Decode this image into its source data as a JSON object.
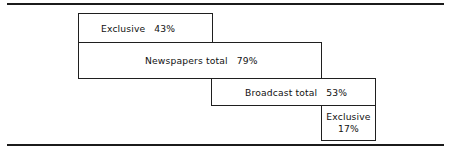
{
  "chart_data": {
    "type": "bar",
    "title": "",
    "subtitle": "",
    "xlabel": "",
    "ylabel": "",
    "orientation": "horizontal",
    "style": "nested staircase / cascading outline bars",
    "grid": false,
    "legend": false,
    "units": "percent",
    "categories": [
      "Exclusive",
      "Newspapers total",
      "Broadcast total",
      "Exclusive"
    ],
    "values": [
      43,
      79,
      53,
      17
    ],
    "value_labels": [
      "43%",
      "79%",
      "53%",
      "17%"
    ],
    "xlim": [
      0,
      100
    ],
    "bars": [
      {
        "label": "Exclusive",
        "value": 43,
        "value_label": "43%",
        "group": "Newspapers",
        "row": 1
      },
      {
        "label": "Newspapers total",
        "value": 79,
        "value_label": "79%",
        "group": "Newspapers",
        "row": 2
      },
      {
        "label": "Broadcast total",
        "value": 53,
        "value_label": "53%",
        "group": "Broadcast",
        "row": 3
      },
      {
        "label": "Exclusive",
        "value": 17,
        "value_label": "17%",
        "group": "Broadcast",
        "row": 4
      }
    ],
    "colors": {
      "background": "#ffffff",
      "bar_fill": "#ffffff",
      "bar_outline": "#1f1f1f",
      "rule": "#1b1b1b",
      "text": "#111111"
    }
  },
  "rules": {
    "top": "horizontal-rule-top",
    "bottom": "horizontal-rule-bottom"
  }
}
